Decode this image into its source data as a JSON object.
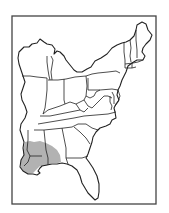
{
  "map": {
    "subject": "Eastern United States range map",
    "style": "black-and-white line drawing",
    "colors": {
      "line": "#222222",
      "frame": "#444444",
      "background": "#ffffff",
      "hatch": "#222222"
    },
    "highlighted_region": {
      "label": "Range (hatched)",
      "pattern": "vertical hatching",
      "areas": [
        "southern Mississippi",
        "southwestern Alabama",
        "eastern Louisiana"
      ]
    },
    "states_outlined": [
      "Maine",
      "New Hampshire",
      "Vermont",
      "Massachusetts",
      "Rhode Island",
      "Connecticut",
      "New York",
      "New Jersey",
      "Pennsylvania",
      "Delaware",
      "Maryland",
      "West Virginia",
      "Virginia",
      "North Carolina",
      "South Carolina",
      "Georgia",
      "Florida",
      "Alabama",
      "Mississippi",
      "Louisiana (east)",
      "Tennessee",
      "Kentucky",
      "Ohio",
      "Indiana",
      "Illinois",
      "Michigan",
      "Wisconsin"
    ]
  }
}
